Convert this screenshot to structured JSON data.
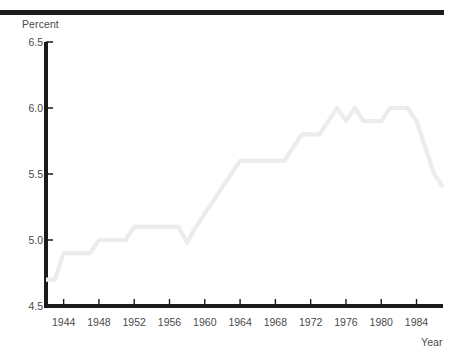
{
  "chart_data": {
    "type": "line",
    "title": "",
    "xlabel": "Year",
    "ylabel": "Percent",
    "xlim": [
      1942,
      1987
    ],
    "ylim": [
      4.5,
      6.5
    ],
    "grid": false,
    "legend": null,
    "line_color": "#ececec",
    "axis_color": "#1b1b1b",
    "text_color": "#4a4a4a",
    "ytick_labels": [
      "6.5",
      "6.0",
      "5.5",
      "5.0",
      "4.5"
    ],
    "ytick_values": [
      6.5,
      6.0,
      5.5,
      5.0,
      4.5
    ],
    "xtick_labels": [
      "1944",
      "1948",
      "1952",
      "1956",
      "1960",
      "1964",
      "1968",
      "1972",
      "1976",
      "1980",
      "1984"
    ],
    "xtick_values": [
      1944,
      1948,
      1952,
      1956,
      1960,
      1964,
      1968,
      1972,
      1976,
      1980,
      1984
    ],
    "x": [
      1942,
      1943,
      1944,
      1945,
      1946,
      1947,
      1948,
      1949,
      1950,
      1951,
      1952,
      1953,
      1954,
      1955,
      1956,
      1957,
      1958,
      1959,
      1960,
      1961,
      1962,
      1963,
      1964,
      1965,
      1966,
      1967,
      1968,
      1969,
      1970,
      1971,
      1972,
      1973,
      1974,
      1975,
      1976,
      1977,
      1978,
      1979,
      1980,
      1981,
      1982,
      1983,
      1984,
      1985,
      1986,
      1987
    ],
    "values": [
      4.7,
      4.7,
      4.9,
      4.9,
      4.9,
      4.9,
      5.0,
      5.0,
      5.0,
      5.0,
      5.1,
      5.1,
      5.1,
      5.1,
      5.1,
      5.1,
      4.98,
      5.1,
      5.2,
      5.3,
      5.4,
      5.5,
      5.6,
      5.6,
      5.6,
      5.6,
      5.6,
      5.6,
      5.7,
      5.8,
      5.8,
      5.8,
      5.9,
      6.0,
      5.9,
      6.0,
      5.9,
      5.9,
      5.9,
      6.0,
      6.0,
      6.0,
      5.9,
      5.7,
      5.5,
      5.4
    ]
  }
}
